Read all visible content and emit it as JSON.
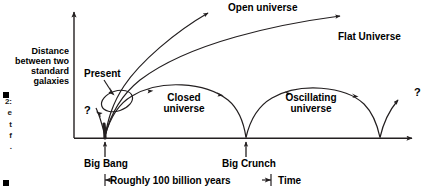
{
  "figure": {
    "domain": "diagram",
    "background_color": "#ffffff",
    "line_color": "#231f20",
    "text_color": "#000000",
    "width": 428,
    "height": 194
  },
  "axes": {
    "y_label": "Distance\nbetween two\nstandard\ngalaxies",
    "x_label": "Time",
    "y_axis_name": "vertical-axis",
    "x_axis_name": "horizontal-axis"
  },
  "annotations": {
    "present": "Present",
    "big_bang": "Big Bang",
    "big_crunch": "Big Crunch",
    "span": "Roughly 100 billion years",
    "question_left": "?",
    "question_right": "?"
  },
  "curves": [
    {
      "id": "open",
      "label": "Open universe"
    },
    {
      "id": "flat",
      "label": "Flat Universe"
    },
    {
      "id": "closed",
      "label": "Closed\nuniverse"
    },
    {
      "id": "oscillating",
      "label": "Oscillating\nuniverse"
    }
  ],
  "caption": {
    "lines": "2:\ne\nt\nf\n.",
    "note": "figure caption cropped at left edge"
  }
}
